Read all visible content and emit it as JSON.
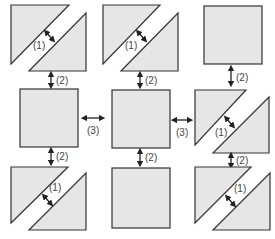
{
  "diagram": {
    "colors": {
      "fill": "#e6e6e6",
      "stroke": "#333333",
      "text": "#444444"
    },
    "labels": {
      "diagonal_gap": "(1)",
      "vertical_gap": "(2)",
      "horizontal_gap": "(3)"
    },
    "grid": [
      [
        "triangle-pair",
        "triangle-pair",
        "square"
      ],
      [
        "square",
        "square",
        "triangle-pair"
      ],
      [
        "triangle-pair",
        "square",
        "triangle-pair"
      ]
    ]
  }
}
